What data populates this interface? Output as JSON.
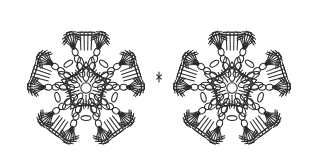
{
  "canvas": {
    "width": 315,
    "height": 168,
    "background_color": "#ffffff",
    "ink_color": "#2b2b2b",
    "ink_color_light": "#4a4a4a"
  },
  "diagram": {
    "name": "crochet-pattern-chart",
    "title": "",
    "motif_count": 2,
    "motifs": [
      {
        "name": "motif-left",
        "center_x": 86,
        "center_y": 88,
        "radius": 66,
        "arm_count": 5,
        "arm_angles_deg": [
          -90,
          -18,
          54,
          126,
          198
        ],
        "rotation_deg": 0
      },
      {
        "name": "motif-right",
        "center_x": 232,
        "center_y": 88,
        "radius": 66,
        "arm_count": 5,
        "arm_angles_deg": [
          -90,
          -18,
          54,
          126,
          198
        ],
        "rotation_deg": 0
      }
    ],
    "join": {
      "name": "motif-join",
      "x": 159,
      "y": 77,
      "note": "side arm tips of the two motifs meet at mid-height"
    },
    "symbols": {
      "treble": {
        "name": "treble-crochet-symbol",
        "glyph": "T-bar on stem",
        "count_per_fan": 7
      },
      "single_crochet": {
        "name": "single-crochet-symbol",
        "glyph": "X",
        "count": 10
      },
      "chain_loop": {
        "name": "chain-loop-symbol",
        "glyph": "oval",
        "count": 30
      },
      "picot": {
        "name": "picot-symbol",
        "glyph": "small oval cluster"
      }
    },
    "geometry": {
      "core_ring_radius": 9,
      "core_petal_count": 5,
      "petal_length": 17,
      "petal_width": 7,
      "inner_loop_radius": 26,
      "arm_spine_loops": 3,
      "fan_spread_deg": 74,
      "fan_stem_length": 15,
      "fan_bar_length": 7,
      "stroke_width": 1.05
    }
  }
}
